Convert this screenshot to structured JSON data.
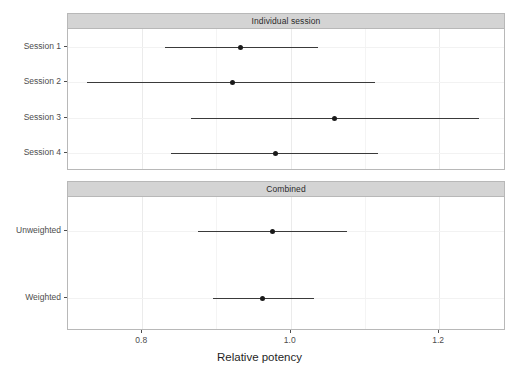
{
  "chart_data": {
    "type": "scatter",
    "subtype": "forest-plot",
    "title": "",
    "xlabel": "Relative potency",
    "ylabel": "",
    "xlim": [
      0.7,
      1.29
    ],
    "xticks": [
      0.8,
      1.0,
      1.2
    ],
    "xtick_labels": [
      "0.8",
      "1.0",
      "1.2"
    ],
    "x_minor_ticks": [
      0.9,
      1.1
    ],
    "grid": true,
    "legend": "none",
    "panels": [
      {
        "strip_label": "Individual session",
        "rows": [
          {
            "label": "Session 1",
            "estimate": 0.933,
            "lower": 0.83,
            "upper": 1.037
          },
          {
            "label": "Session 2",
            "estimate": 0.921,
            "lower": 0.726,
            "upper": 1.113
          },
          {
            "label": "Session 3",
            "estimate": 1.059,
            "lower": 0.866,
            "upper": 1.253
          },
          {
            "label": "Session 4",
            "estimate": 0.98,
            "lower": 0.839,
            "upper": 1.118
          }
        ]
      },
      {
        "strip_label": "Combined",
        "rows": [
          {
            "label": "Unweighted",
            "estimate": 0.976,
            "lower": 0.875,
            "upper": 1.076
          },
          {
            "label": "Weighted",
            "estimate": 0.962,
            "lower": 0.895,
            "upper": 1.032
          }
        ]
      }
    ]
  },
  "colors": {
    "point": "#1a1a1a",
    "line": "#3a3a3a",
    "strip_background": "#d4d4d4",
    "panel_border": "#b8b8b8",
    "gridline_major": "#ebebeb",
    "gridline_minor": "#f4f4f4",
    "axis_text": "#4d4d4d",
    "title_text": "#1f1f1f",
    "background": "#ffffff"
  }
}
